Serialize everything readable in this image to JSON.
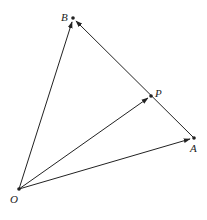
{
  "diagram": {
    "type": "vector-triangle",
    "points": {
      "O": {
        "label": "O",
        "x": 19,
        "y": 189
      },
      "A": {
        "label": "A",
        "x": 194,
        "y": 138
      },
      "B": {
        "label": "B",
        "x": 73,
        "y": 18
      },
      "P": {
        "label": "P",
        "x": 151,
        "y": 96
      }
    },
    "vectors": [
      {
        "from": "O",
        "to": "B"
      },
      {
        "from": "O",
        "to": "P"
      },
      {
        "from": "O",
        "to": "A"
      },
      {
        "from": "A",
        "to": "B"
      }
    ],
    "colors": {
      "stroke": "#222222",
      "background": "#ffffff"
    }
  }
}
